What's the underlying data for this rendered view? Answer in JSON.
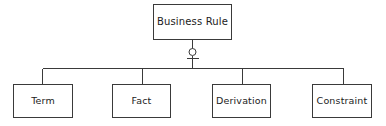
{
  "diagram": {
    "type": "generalization-hierarchy",
    "colors": {
      "background": "#ffffff",
      "line": "#3a3a3a",
      "box_fill": "#ffffff",
      "text": "#222222"
    },
    "root": {
      "label": "Business Rule"
    },
    "connector": {
      "marker": "hollow-circle",
      "marker_note": "small open circle with short horizontal crossbar beneath on the vertical connector"
    },
    "children": [
      {
        "label": "Term"
      },
      {
        "label": "Fact"
      },
      {
        "label": "Derivation"
      },
      {
        "label": "Constraint"
      }
    ]
  }
}
